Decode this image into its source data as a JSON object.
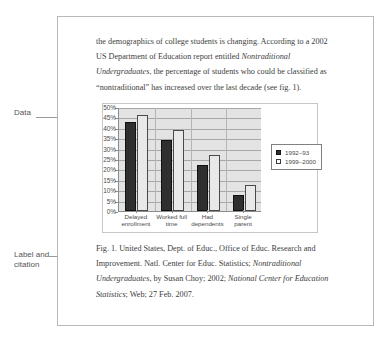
{
  "annotations": {
    "data_label": "Data",
    "label_citation": "Label and\ncitation"
  },
  "document": {
    "paragraph": {
      "seg1": "the demographics of college students is changing. According to a 2002 US Department of Education report entitled ",
      "em1": "Nontraditional Undergraduates",
      "seg2": ", the percentage of students who could be classified as “nontraditional” has increased over the last decade (see fig. 1)."
    },
    "caption": {
      "seg1": "Fig. 1. United States, Dept. of Educ., Office of Educ. Research and Improvement. Natl. Center for Educ. Statistics; ",
      "em1": "Nontraditional Undergraduates",
      "seg2": ", by Susan Choy; 2002; ",
      "em2": "National Center for Education Statistics",
      "seg3": "; Web; 27 Feb. 2007."
    }
  },
  "chart_data": {
    "type": "bar",
    "title": "",
    "xlabel": "",
    "ylabel": "",
    "ylim": [
      0,
      50
    ],
    "ytick_labels": [
      "50%",
      "45%",
      "40%",
      "35%",
      "30%",
      "25%",
      "20%",
      "15%",
      "10%",
      "5%",
      "0%"
    ],
    "ytick_values": [
      50,
      45,
      40,
      35,
      30,
      25,
      20,
      15,
      10,
      5,
      0
    ],
    "grid": true,
    "legend_position": "right",
    "categories": [
      "Delayed enrollment",
      "Worked full time",
      "Had dependents",
      "Single parent"
    ],
    "series": [
      {
        "name": "1992–93",
        "values": [
          43,
          34,
          22,
          7.5
        ]
      },
      {
        "name": "1999–2000",
        "values": [
          46,
          39,
          27,
          12.5
        ]
      }
    ]
  }
}
